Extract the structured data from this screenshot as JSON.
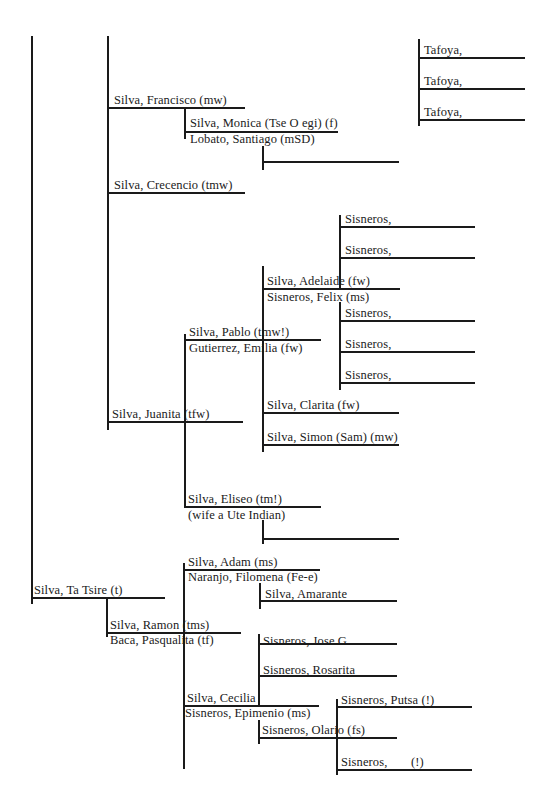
{
  "diagram": {
    "type": "genealogy-tree",
    "people": {
      "ta_tsire": "Silva, Ta Tsire (t)",
      "francisco": "Silva, Francisco (mw)",
      "monica": "Silva, Monica (Tse O egi) (f)",
      "santiago": "Lobato, Santiago (mSD)",
      "crecencio": "Silva, Crecencio (tmw)",
      "juanita": "Silva, Juanita (tfw)",
      "pablo": "Silva, Pablo (tmw!)",
      "emilia": "Gutierrez, Emilia (fw)",
      "adelaide": "Silva, Adelaide (fw)",
      "felix": "Sisneros, Felix (ms)",
      "clarita": "Silva, Clarita (fw)",
      "simon": "Silva, Simon (Sam) (mw)",
      "eliseo": "Silva, Eliseo (tm!)",
      "eliseo_wife": "(wife a Ute Indian)",
      "adam": "Silva, Adam (ms)",
      "filomena": "Naranjo, Filomena (Fe-e)",
      "amarante": "Silva, Amarante",
      "ramon": "Silva, Ramon (tms)",
      "pasqualita": "Baca, Pasqualita (tf)",
      "jose": "Sisneros, Jose G.",
      "rosarita": "Sisneros, Rosarita",
      "cecilia": "Silva, Cecilia",
      "epimenio": "Sisneros, Epimenio (ms)",
      "putsa": "Sisneros, Putsa (!)",
      "olario": "Sisneros, Olario (fs)",
      "sisneros_unnamed": "Sisneros,",
      "sisneros_unnamed_mark": "(!)"
    },
    "tafoya_children": [
      "Tafoya,",
      "Tafoya,",
      "Tafoya,"
    ],
    "adelaide_children": [
      "Sisneros,",
      "Sisneros,",
      "Sisneros,",
      "Sisneros,",
      "Sisneros,"
    ]
  }
}
